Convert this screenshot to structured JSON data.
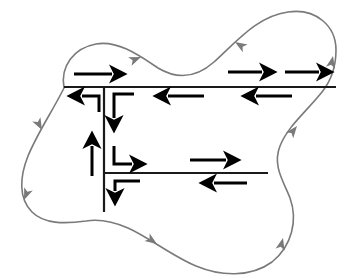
{
  "figure": {
    "width": 347,
    "height": 280,
    "background_color": "#ffffff",
    "boundary_color": "#7a7a7a",
    "cut_color": "#1a1a1a",
    "arrow_color": "#000000",
    "boundary_stroke_width": 1.6,
    "cut_stroke_width": 2.2,
    "arrow_stroke_width": 3.0
  },
  "outer_boundary": {
    "name": "outer-boundary-curve",
    "orientation": "counterclockwise",
    "path": "M 64 88 C 60 66, 74 48, 96 44 C 118 40, 140 56, 158 68 C 178 80, 196 78, 214 62 C 238 40, 258 16, 288 12 C 316 8, 336 26, 336 50 C 336 70, 330 82, 322 92 C 306 112, 288 126, 280 146 C 272 166, 284 182, 290 198 C 298 220, 292 246, 272 262 C 250 278, 220 276, 196 266 C 172 256, 150 238, 128 228 C 112 221, 98 219, 86 221 C 64 224, 44 224, 32 212 C 18 198, 20 176, 28 156 C 38 132, 52 112, 64 88 Z",
    "arrows": [
      {
        "name": "boundary-arrow-top-left-lobe",
        "direction": "right",
        "x": 141,
        "y": 57,
        "angle": -22
      },
      {
        "name": "boundary-arrow-top-right-lobe",
        "direction": "left",
        "x": 235,
        "y": 42,
        "angle": 212
      },
      {
        "name": "boundary-arrow-right-upper",
        "direction": "up-right",
        "x": 332,
        "y": 54,
        "angle": -75
      },
      {
        "name": "boundary-arrow-right-middle",
        "direction": "up-right",
        "x": 296,
        "y": 128,
        "angle": -55
      },
      {
        "name": "boundary-arrow-bottom-right",
        "direction": "up",
        "x": 281,
        "y": 243,
        "angle": -72
      },
      {
        "name": "boundary-arrow-bottom-middle",
        "direction": "down-right",
        "x": 155,
        "y": 242,
        "angle": 36
      },
      {
        "name": "boundary-arrow-bottom-left",
        "direction": "down-left",
        "x": 25,
        "y": 202,
        "angle": 110
      },
      {
        "name": "boundary-arrow-left-upper",
        "direction": "down",
        "x": 41,
        "y": 127,
        "angle": 62
      }
    ]
  },
  "cut_lines": [
    {
      "name": "cut-line-horizontal-upper",
      "x1": 64,
      "y1": 87,
      "x2": 336,
      "y2": 87
    },
    {
      "name": "cut-line-horizontal-lower",
      "x1": 104,
      "y1": 173,
      "x2": 268,
      "y2": 173
    },
    {
      "name": "cut-line-vertical",
      "x1": 104,
      "y1": 87,
      "x2": 104,
      "y2": 212
    }
  ],
  "traversal_arrows": [
    {
      "name": "arrow-upper-cut-above-left",
      "label": "right",
      "x1": 74,
      "y1": 74,
      "x2": 118,
      "y2": 74,
      "direction": "right"
    },
    {
      "name": "arrow-upper-cut-above-mid",
      "label": "right",
      "x1": 228,
      "y1": 72,
      "x2": 268,
      "y2": 72,
      "direction": "right"
    },
    {
      "name": "arrow-upper-cut-above-right",
      "label": "right",
      "x1": 285,
      "y1": 72,
      "x2": 325,
      "y2": 72,
      "direction": "right"
    },
    {
      "name": "arrow-upper-cut-below-mid",
      "label": "left",
      "x1": 204,
      "y1": 95,
      "x2": 162,
      "y2": 95,
      "direction": "left"
    },
    {
      "name": "arrow-upper-cut-below-right",
      "label": "left",
      "x1": 292,
      "y1": 95,
      "x2": 250,
      "y2": 95,
      "direction": "left"
    },
    {
      "name": "arrow-lower-cut-above",
      "label": "right",
      "x1": 190,
      "y1": 160,
      "x2": 232,
      "y2": 160,
      "direction": "right"
    },
    {
      "name": "arrow-lower-cut-below",
      "label": "left",
      "x1": 247,
      "y1": 182,
      "x2": 208,
      "y2": 182,
      "direction": "left"
    }
  ],
  "elbow_arrows": [
    {
      "name": "elbow-arrow-upper-left-out",
      "description": "from vertical cut top, left then arrowhead left",
      "path": "M 99 110 L 99 96 L 76 96",
      "head_x": 70,
      "head_y": 96,
      "head_angle": 180
    },
    {
      "name": "elbow-arrow-upper-down",
      "description": "from upper cut right of vertical, down with arrowhead",
      "path": "M 133 94 L 113 94 L 113 116",
      "head_x": 113,
      "head_y": 124,
      "head_angle": 90
    },
    {
      "name": "elbow-arrow-mid-up",
      "description": "up arrow along left of vertical cut",
      "path": "M 92 175 L 92 150",
      "head_x": 92,
      "head_y": 140,
      "head_angle": -90
    },
    {
      "name": "elbow-arrow-mid-right",
      "description": "from vertical cut down then right with arrowhead",
      "path": "M 113 146 L 113 164 L 136 164",
      "head_x": 144,
      "head_y": 164,
      "head_angle": 0
    },
    {
      "name": "elbow-arrow-lower-down",
      "description": "below lower junction, left then down with arrowhead",
      "path": "M 137 181 L 114 181 L 114 194",
      "head_x": 114,
      "head_y": 203,
      "head_angle": 90
    }
  ],
  "legend": {
    "black_arrows_meaning": "internal cut traversal directions",
    "gray_arrows_meaning": "outer boundary positive orientation"
  }
}
